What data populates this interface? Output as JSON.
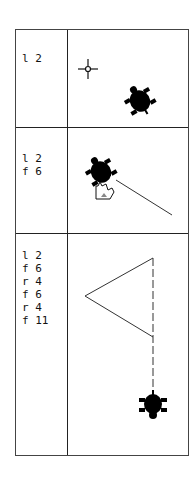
{
  "rows": [
    {
      "commands": "l 2",
      "description": "turtle rotated left 2 units; cursor crosshair shown"
    },
    {
      "commands": "l 2\nf 6",
      "description": "turtle moved forward 6 drawing a line, hand cursor"
    },
    {
      "commands": "l 2\nf 6\nr 4\nf 6\nr 4\nf 11",
      "description": "triangle drawn, turtle at bottom after forward 11"
    }
  ]
}
